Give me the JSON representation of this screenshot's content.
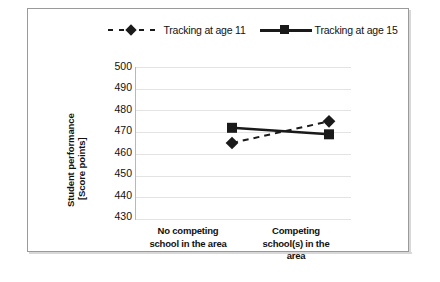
{
  "chart_data": {
    "type": "line",
    "title": "",
    "xlabel": "",
    "ylabel": "Student performance [Score points]",
    "ylabel_line1": "Student performance",
    "ylabel_line2": "[Score points]",
    "categories": [
      "No competing school in the area",
      "Competing school(s) in the area"
    ],
    "category_lines": [
      [
        "No competing",
        "school in the area"
      ],
      [
        "Competing",
        "school(s) in the",
        "area"
      ]
    ],
    "yticks": [
      500,
      490,
      480,
      470,
      460,
      450,
      440,
      430
    ],
    "ylim": [
      430,
      500
    ],
    "grid": true,
    "legend_position": "top",
    "series": [
      {
        "name": "Tracking at age 11",
        "values": [
          465,
          475
        ],
        "marker": "diamond",
        "linestyle": "dashed",
        "color": "#1a1a1a"
      },
      {
        "name": "Tracking at age 15",
        "values": [
          472,
          469
        ],
        "marker": "square",
        "linestyle": "solid",
        "color": "#1a1a1a"
      }
    ]
  },
  "legend": {
    "items": [
      {
        "label": "Tracking at age 11",
        "marker": "diamond-marker"
      },
      {
        "label": "Tracking at age 15",
        "marker": "square-marker"
      }
    ]
  },
  "yaxis": {
    "t0": "500",
    "t1": "490",
    "t2": "480",
    "t3": "470",
    "t4": "460",
    "t5": "450",
    "t6": "440",
    "t7": "430"
  },
  "xaxis": {
    "cat1_l1": "No competing",
    "cat1_l2": "school in the area",
    "cat2_l1": "Competing",
    "cat2_l2": "school(s) in the",
    "cat2_l3": "area"
  },
  "colors": {
    "series": "#1a1a1a",
    "grid": "#e3e3e3",
    "border": "#9a9a9a"
  }
}
